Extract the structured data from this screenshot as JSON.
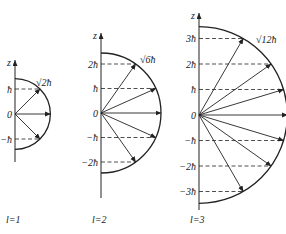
{
  "diagrams": [
    {
      "l": 1,
      "caption": "l=1",
      "magnitude_label": "√2ħ",
      "axis_label": "z",
      "tick_labels": [
        "ħ",
        "0",
        "−ħ"
      ],
      "m_values": [
        1,
        0,
        -1
      ]
    },
    {
      "l": 2,
      "caption": "l=2",
      "magnitude_label": "√6ħ",
      "axis_label": "z",
      "tick_labels": [
        "2ħ",
        "ħ",
        "0",
        "−ħ",
        "−2ħ"
      ],
      "m_values": [
        2,
        1,
        0,
        -1,
        -2
      ]
    },
    {
      "l": 3,
      "caption": "l=3",
      "magnitude_label": "√12ħ",
      "axis_label": "z",
      "tick_labels": [
        "3ħ",
        "2ħ",
        "ħ",
        "0",
        "−ħ",
        "−2ħ",
        "−3ħ"
      ],
      "m_values": [
        3,
        2,
        1,
        0,
        -1,
        -2,
        -3
      ]
    }
  ],
  "colors": {
    "line": "#222222",
    "background": "#ffffff"
  }
}
